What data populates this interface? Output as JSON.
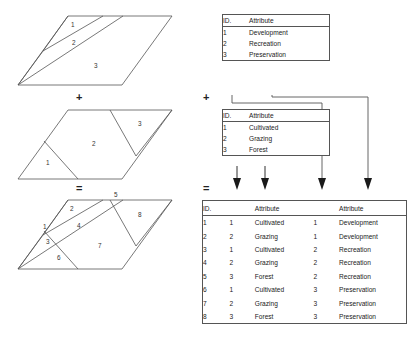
{
  "diagram": {
    "operators": {
      "plus": "+",
      "equals": "="
    },
    "line_color": "#555555",
    "text_color": "#222222"
  },
  "maps": [
    {
      "name": "layer-one",
      "caption": "",
      "region_labels": [
        "1",
        "2",
        "3"
      ]
    },
    {
      "name": "layer-two",
      "caption": "",
      "region_labels": [
        "1",
        "2",
        "3"
      ]
    },
    {
      "name": "overlay-result",
      "caption": "",
      "region_labels": [
        "1",
        "2",
        "3",
        "4",
        "5",
        "6",
        "7",
        "8"
      ]
    }
  ],
  "table_one": {
    "headers": [
      "ID.",
      "Attribute"
    ],
    "rows": [
      [
        "1",
        "Development"
      ],
      [
        "2",
        "Recreation"
      ],
      [
        "3",
        "Preservation"
      ]
    ]
  },
  "table_two": {
    "headers": [
      "ID.",
      "Attribute"
    ],
    "rows": [
      [
        "1",
        "Cultivated"
      ],
      [
        "2",
        "Grazing"
      ],
      [
        "3",
        "Forest"
      ]
    ]
  },
  "table_result": {
    "headers": [
      "ID.",
      "",
      "Attribute",
      "",
      "Attribute"
    ],
    "rows": [
      [
        "1",
        "1",
        "Cultivated",
        "1",
        "Development"
      ],
      [
        "2",
        "2",
        "Grazing",
        "1",
        "Development"
      ],
      [
        "3",
        "1",
        "Cultivated",
        "2",
        "Recreation"
      ],
      [
        "4",
        "2",
        "Grazing",
        "2",
        "Recreation"
      ],
      [
        "5",
        "3",
        "Forest",
        "2",
        "Recreation"
      ],
      [
        "6",
        "1",
        "Cultivated",
        "3",
        "Preservation"
      ],
      [
        "7",
        "2",
        "Grazing",
        "3",
        "Preservation"
      ],
      [
        "8",
        "3",
        "Forest",
        "3",
        "Preservation"
      ]
    ]
  }
}
